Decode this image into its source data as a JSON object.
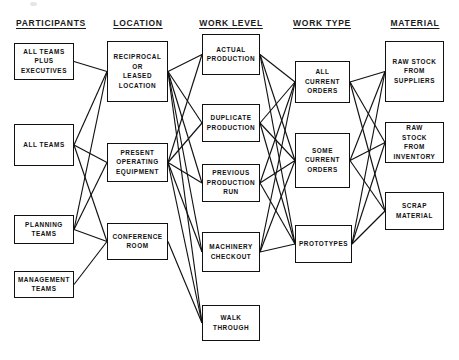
{
  "diagram": {
    "background_color": "#ffffff",
    "line_color": "#111111",
    "text_color": "#111111",
    "columns": [
      {
        "id": "participants",
        "label": "PARTICIPANTS",
        "header_x": 51,
        "header_y": 18
      },
      {
        "id": "location",
        "label": "LOCATION",
        "header_x": 138,
        "header_y": 18
      },
      {
        "id": "work_level",
        "label": "WORK LEVEL",
        "header_x": 231,
        "header_y": 18
      },
      {
        "id": "work_type",
        "label": "WORK TYPE",
        "header_x": 322,
        "header_y": 18
      },
      {
        "id": "material",
        "label": "MATERIAL",
        "header_x": 415,
        "header_y": 18
      }
    ],
    "nodes": [
      {
        "id": "all_teams_plus_exec",
        "column": "participants",
        "lines": [
          "ALL TEAMS",
          "PLUS",
          "EXECUTIVES"
        ],
        "x": 14,
        "y": 43,
        "w": 60,
        "h": 37
      },
      {
        "id": "all_teams",
        "column": "participants",
        "lines": [
          "ALL TEAMS"
        ],
        "x": 14,
        "y": 124,
        "w": 60,
        "h": 42
      },
      {
        "id": "planning_teams",
        "column": "participants",
        "lines": [
          "PLANNING",
          "TEAMS"
        ],
        "x": 14,
        "y": 215,
        "w": 60,
        "h": 29
      },
      {
        "id": "management_teams",
        "column": "participants",
        "lines": [
          "MANAGEMENT",
          "TEAMS"
        ],
        "x": 14,
        "y": 271,
        "w": 60,
        "h": 27
      },
      {
        "id": "reciprocal_or_leased_location",
        "column": "location",
        "lines": [
          "RECIPROCAL",
          "OR",
          "LEASED",
          "LOCATION"
        ],
        "x": 107,
        "y": 41,
        "w": 61,
        "h": 61
      },
      {
        "id": "present_operating_equipment",
        "column": "location",
        "lines": [
          "PRESENT",
          "OPERATING",
          "EQUIPMENT"
        ],
        "x": 107,
        "y": 143,
        "w": 61,
        "h": 39
      },
      {
        "id": "conference_room",
        "column": "location",
        "lines": [
          "CONFERENCE",
          "ROOM"
        ],
        "x": 107,
        "y": 223,
        "w": 61,
        "h": 37
      },
      {
        "id": "actual_production",
        "column": "work_level",
        "lines": [
          "ACTUAL",
          "PRODUCTION"
        ],
        "x": 202,
        "y": 34,
        "w": 58,
        "h": 41
      },
      {
        "id": "duplicate_production",
        "column": "work_level",
        "lines": [
          "DUPLICATE",
          "PRODUCTION"
        ],
        "x": 202,
        "y": 104,
        "w": 58,
        "h": 38
      },
      {
        "id": "previous_production_run",
        "column": "work_level",
        "lines": [
          "PREVIOUS",
          "PRODUCTION",
          "RUN"
        ],
        "x": 202,
        "y": 164,
        "w": 58,
        "h": 38
      },
      {
        "id": "machinery_checkout",
        "column": "work_level",
        "lines": [
          "MACHINERY",
          "CHECKOUT"
        ],
        "x": 202,
        "y": 232,
        "w": 58,
        "h": 40
      },
      {
        "id": "walk_through",
        "column": "work_level",
        "lines": [
          "WALK",
          "THROUGH"
        ],
        "x": 202,
        "y": 305,
        "w": 58,
        "h": 36
      },
      {
        "id": "all_current_orders",
        "column": "work_type",
        "lines": [
          "ALL",
          "CURRENT",
          "ORDERS"
        ],
        "x": 295,
        "y": 61,
        "w": 55,
        "h": 42
      },
      {
        "id": "some_current_orders",
        "column": "work_type",
        "lines": [
          "SOME",
          "CURRENT",
          "ORDERS"
        ],
        "x": 295,
        "y": 133,
        "w": 55,
        "h": 55
      },
      {
        "id": "prototypes",
        "column": "work_type",
        "lines": [
          "PROTOTYPES"
        ],
        "x": 295,
        "y": 225,
        "w": 57,
        "h": 38
      },
      {
        "id": "raw_stock_from_suppliers",
        "column": "material",
        "lines": [
          "RAW STOCK",
          "FROM",
          "SUPPLIERS"
        ],
        "x": 385,
        "y": 41,
        "w": 59,
        "h": 61
      },
      {
        "id": "raw_stock_from_inventory",
        "column": "material",
        "lines": [
          "RAW",
          "STOCK",
          "FROM",
          "INVENTORY"
        ],
        "x": 385,
        "y": 122,
        "w": 59,
        "h": 41
      },
      {
        "id": "scrap_material",
        "column": "material",
        "lines": [
          "SCRAP",
          "MATERIAL"
        ],
        "x": 385,
        "y": 192,
        "w": 59,
        "h": 38
      }
    ],
    "edges": [
      {
        "from": "all_teams_plus_exec",
        "to": "reciprocal_or_leased_location"
      },
      {
        "from": "all_teams",
        "to": "reciprocal_or_leased_location"
      },
      {
        "from": "all_teams",
        "to": "present_operating_equipment"
      },
      {
        "from": "all_teams",
        "to": "conference_room"
      },
      {
        "from": "planning_teams",
        "to": "reciprocal_or_leased_location"
      },
      {
        "from": "planning_teams",
        "to": "present_operating_equipment"
      },
      {
        "from": "planning_teams",
        "to": "conference_room"
      },
      {
        "from": "management_teams",
        "to": "conference_room"
      },
      {
        "from": "reciprocal_or_leased_location",
        "to": "actual_production"
      },
      {
        "from": "reciprocal_or_leased_location",
        "to": "duplicate_production"
      },
      {
        "from": "reciprocal_or_leased_location",
        "to": "previous_production_run"
      },
      {
        "from": "reciprocal_or_leased_location",
        "to": "machinery_checkout"
      },
      {
        "from": "reciprocal_or_leased_location",
        "to": "walk_through"
      },
      {
        "from": "present_operating_equipment",
        "to": "actual_production"
      },
      {
        "from": "present_operating_equipment",
        "to": "duplicate_production"
      },
      {
        "from": "present_operating_equipment",
        "to": "previous_production_run"
      },
      {
        "from": "present_operating_equipment",
        "to": "machinery_checkout"
      },
      {
        "from": "present_operating_equipment",
        "to": "walk_through"
      },
      {
        "from": "conference_room",
        "to": "walk_through"
      },
      {
        "from": "actual_production",
        "to": "all_current_orders"
      },
      {
        "from": "actual_production",
        "to": "some_current_orders"
      },
      {
        "from": "actual_production",
        "to": "prototypes"
      },
      {
        "from": "duplicate_production",
        "to": "all_current_orders"
      },
      {
        "from": "duplicate_production",
        "to": "some_current_orders"
      },
      {
        "from": "duplicate_production",
        "to": "prototypes"
      },
      {
        "from": "previous_production_run",
        "to": "all_current_orders"
      },
      {
        "from": "previous_production_run",
        "to": "some_current_orders"
      },
      {
        "from": "previous_production_run",
        "to": "prototypes"
      },
      {
        "from": "machinery_checkout",
        "to": "all_current_orders"
      },
      {
        "from": "machinery_checkout",
        "to": "some_current_orders"
      },
      {
        "from": "machinery_checkout",
        "to": "prototypes"
      },
      {
        "from": "all_current_orders",
        "to": "raw_stock_from_suppliers"
      },
      {
        "from": "all_current_orders",
        "to": "raw_stock_from_inventory"
      },
      {
        "from": "all_current_orders",
        "to": "scrap_material"
      },
      {
        "from": "some_current_orders",
        "to": "raw_stock_from_suppliers"
      },
      {
        "from": "some_current_orders",
        "to": "raw_stock_from_inventory"
      },
      {
        "from": "some_current_orders",
        "to": "scrap_material"
      },
      {
        "from": "prototypes",
        "to": "raw_stock_from_suppliers"
      },
      {
        "from": "prototypes",
        "to": "raw_stock_from_inventory"
      },
      {
        "from": "prototypes",
        "to": "scrap_material"
      }
    ]
  }
}
